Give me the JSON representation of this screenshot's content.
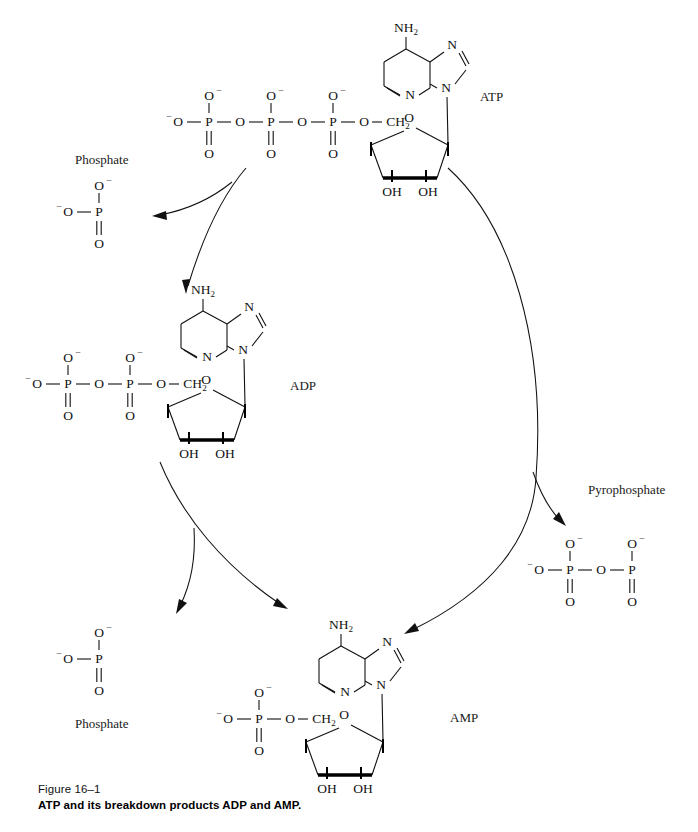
{
  "figure": {
    "number": "Figure 16–1",
    "caption": "ATP and its breakdown products ADP and AMP."
  },
  "colors": {
    "ink": "#111111",
    "background": "#ffffff",
    "bond": "#111111"
  },
  "molecules": {
    "atp": {
      "label": "ATP",
      "phosphate_count": 3,
      "base_name": "NH",
      "base_sub": "2",
      "ring_nitrogens": [
        "N",
        "N",
        "N"
      ],
      "sugar_oxygen": "O",
      "ch2": "CH",
      "ch2_sub": "2",
      "hydroxyl_left": "OH",
      "hydroxyl_right": "OH",
      "terminal_oxygen": "O",
      "charge": "–",
      "bridge_oxygen": "O",
      "double_bond_oxygen": "O",
      "phosphorus": "P"
    },
    "adp": {
      "label": "ADP",
      "phosphate_count": 2,
      "base_name": "NH",
      "base_sub": "2",
      "sugar_oxygen": "O",
      "ch2": "CH",
      "ch2_sub": "2",
      "hydroxyl_left": "OH",
      "hydroxyl_right": "OH",
      "phosphorus": "P"
    },
    "amp": {
      "label": "AMP",
      "phosphate_count": 1,
      "base_name": "NH",
      "base_sub": "2",
      "sugar_oxygen": "O",
      "ch2": "CH",
      "ch2_sub": "2",
      "hydroxyl_left": "OH",
      "hydroxyl_right": "OH",
      "phosphorus": "P"
    }
  },
  "byproducts": {
    "phosphate_top": {
      "label": "Phosphate",
      "label_position": "above",
      "phosphorus": "P",
      "oxygen": "O"
    },
    "phosphate_bottom": {
      "label": "Phosphate",
      "label_position": "below",
      "phosphorus": "P",
      "oxygen": "O"
    },
    "pyrophosphate": {
      "label": "Pyrophosphate",
      "label_position": "above",
      "phosphorus": "P",
      "oxygen": "O",
      "phosphate_count": 2
    }
  },
  "reactions": [
    {
      "id": "atp-to-adp",
      "from": "ATP",
      "to": "ADP",
      "releases": "Phosphate"
    },
    {
      "id": "adp-to-amp",
      "from": "ADP",
      "to": "AMP",
      "releases": "Phosphate"
    },
    {
      "id": "atp-to-amp",
      "from": "ATP",
      "to": "AMP",
      "releases": "Pyrophosphate"
    }
  ]
}
